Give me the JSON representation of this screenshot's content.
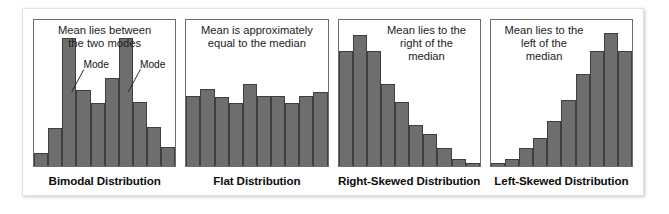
{
  "figure": {
    "background": "#ffffff",
    "border_color": "#e2e2e2"
  },
  "style": {
    "bar_fill": "#6e6e6e",
    "bar_stroke": "#3f3f3f",
    "panel_border": "#6d6d6d",
    "text_color": "#1b1b1b"
  },
  "chart_data": [
    {
      "type": "bar",
      "title": "Bimodal Distribution",
      "annotation": "Mean lies between\nthe two modes",
      "xlabel": "",
      "ylabel": "",
      "grid": false,
      "ylim": [
        0,
        100
      ],
      "categories": [
        "1",
        "2",
        "3",
        "4",
        "5",
        "6",
        "7",
        "8",
        "9",
        "10"
      ],
      "values": [
        9,
        26,
        88,
        52,
        43,
        60,
        88,
        44,
        27,
        13
      ],
      "point_labels": [
        {
          "text": "Mode",
          "bar_index": 2
        },
        {
          "text": "Mode",
          "bar_index": 6
        }
      ]
    },
    {
      "type": "bar",
      "title": "Flat Distribution",
      "annotation": "Mean is approximately\nequal to the median",
      "xlabel": "",
      "ylabel": "",
      "grid": false,
      "ylim": [
        0,
        100
      ],
      "categories": [
        "1",
        "2",
        "3",
        "4",
        "5",
        "6",
        "7",
        "8",
        "9",
        "10"
      ],
      "values": [
        48,
        53,
        47,
        43,
        56,
        48,
        48,
        43,
        48,
        51
      ],
      "point_labels": []
    },
    {
      "type": "bar",
      "title": "Right-Skewed Distribution",
      "annotation": "Mean lies to the\nright of the\nmedian",
      "xlabel": "",
      "ylabel": "",
      "grid": false,
      "ylim": [
        0,
        100
      ],
      "categories": [
        "1",
        "2",
        "3",
        "4",
        "5",
        "6",
        "7",
        "8",
        "9",
        "10"
      ],
      "values": [
        79,
        90,
        79,
        56,
        44,
        28,
        22,
        12,
        5,
        2
      ],
      "point_labels": []
    },
    {
      "type": "bar",
      "title": "Left-Skewed Distribution",
      "annotation": "Mean lies to the\nleft of the\nmedian",
      "xlabel": "",
      "ylabel": "",
      "grid": false,
      "ylim": [
        0,
        100
      ],
      "categories": [
        "1",
        "2",
        "3",
        "4",
        "5",
        "6",
        "7",
        "8",
        "9",
        "10"
      ],
      "values": [
        2,
        5,
        12,
        19,
        31,
        45,
        63,
        79,
        91,
        79
      ],
      "point_labels": []
    }
  ]
}
